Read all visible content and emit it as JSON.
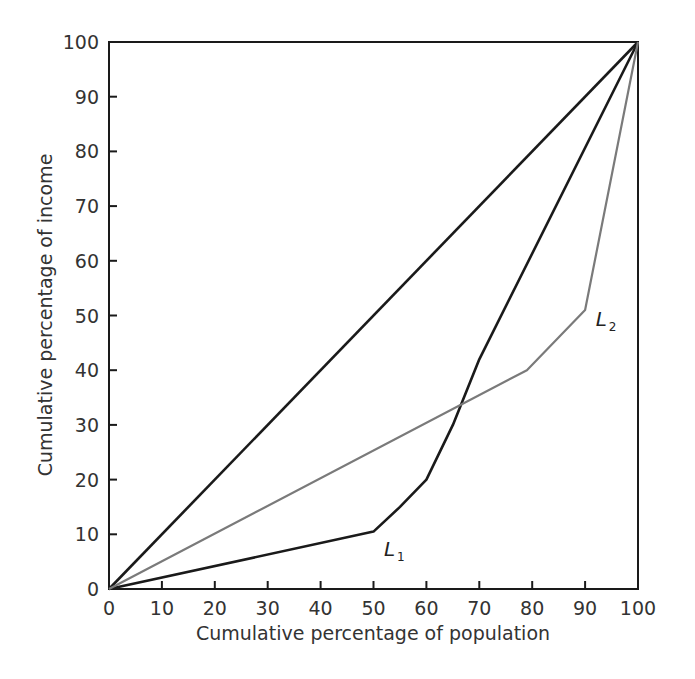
{
  "chart_data": {
    "type": "line",
    "title": "",
    "xlabel": "Cumulative percentage of population",
    "ylabel": "Cumulative percentage of income",
    "xlim": [
      0,
      100
    ],
    "ylim": [
      0,
      100
    ],
    "x_ticks": [
      0,
      10,
      20,
      30,
      40,
      50,
      60,
      70,
      80,
      90,
      100
    ],
    "y_ticks": [
      0,
      10,
      20,
      30,
      40,
      50,
      60,
      70,
      80,
      90,
      100
    ],
    "grid": false,
    "legend": "none (inline curve labels)",
    "series": [
      {
        "name": "Line of equality",
        "color": "#1a1a1a",
        "points": [
          [
            0,
            0
          ],
          [
            100,
            100
          ]
        ]
      },
      {
        "name": "L1",
        "label": "L",
        "subscript": "1",
        "color": "#1a1a1a",
        "points": [
          [
            0,
            0
          ],
          [
            50,
            10.5
          ],
          [
            55,
            15
          ],
          [
            60,
            20
          ],
          [
            65,
            30
          ],
          [
            70,
            42
          ],
          [
            100,
            100
          ]
        ]
      },
      {
        "name": "L2",
        "label": "L",
        "subscript": "2",
        "color": "#7a7a7a",
        "points": [
          [
            0,
            0
          ],
          [
            79,
            40
          ],
          [
            90,
            51
          ],
          [
            100,
            100
          ]
        ]
      }
    ],
    "annotations": [
      {
        "text": "L1",
        "x": 52,
        "y": 6
      },
      {
        "text": "L2",
        "x": 92,
        "y": 48
      }
    ]
  }
}
